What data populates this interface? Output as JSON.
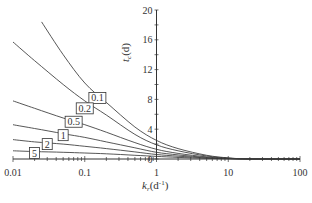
{
  "chart_data": {
    "type": "line",
    "title": "",
    "xlabel": "k_r(d⁻¹)",
    "xlabel_main": "k",
    "xlabel_sub": "r",
    "xlabel_unit": "(d",
    "xlabel_sup": "-1",
    "xlabel_close": ")",
    "ylabel": "t_c(d)",
    "ylabel_main": "t",
    "ylabel_sub": "c",
    "ylabel_unit": "(d)",
    "xscale": "log",
    "xlim": [
      0.01,
      100
    ],
    "ylim": [
      0,
      20
    ],
    "grid": false,
    "legend": "inline labels on curves",
    "x_tick_labels": [
      "0.01",
      "0.1",
      "1",
      "10",
      "100"
    ],
    "y_tick_labels": [
      "0",
      "4",
      "8",
      "12",
      "16",
      "20"
    ],
    "series": [
      {
        "name": "0.1",
        "x": [
          0.025,
          0.05,
          0.1,
          0.2,
          0.5,
          1,
          2,
          5,
          10,
          20,
          100
        ],
        "y": [
          18.4,
          14.0,
          10.2,
          7.6,
          4.3,
          2.5,
          1.4,
          0.5,
          0.15,
          0.02,
          0
        ]
      },
      {
        "name": "0.2",
        "x": [
          0.01,
          0.02,
          0.05,
          0.1,
          0.2,
          0.5,
          1,
          2,
          5,
          10,
          20,
          100
        ],
        "y": [
          15.7,
          13.2,
          10.0,
          7.8,
          5.9,
          3.3,
          1.9,
          1.1,
          0.4,
          0.12,
          0.02,
          0
        ]
      },
      {
        "name": "0.5",
        "x": [
          0.01,
          0.02,
          0.05,
          0.1,
          0.2,
          0.5,
          1,
          2,
          5,
          10,
          20,
          100
        ],
        "y": [
          7.8,
          6.8,
          5.5,
          4.6,
          3.6,
          2.2,
          1.3,
          0.75,
          0.28,
          0.09,
          0.01,
          0
        ]
      },
      {
        "name": "1",
        "x": [
          0.01,
          0.02,
          0.05,
          0.1,
          0.2,
          0.5,
          1,
          2,
          5,
          10,
          20,
          100
        ],
        "y": [
          4.6,
          4.1,
          3.4,
          2.9,
          2.3,
          1.5,
          0.9,
          0.55,
          0.2,
          0.07,
          0.01,
          0
        ]
      },
      {
        "name": "2",
        "x": [
          0.01,
          0.02,
          0.05,
          0.1,
          0.2,
          0.5,
          1,
          2,
          5,
          10,
          20,
          100
        ],
        "y": [
          2.6,
          2.3,
          2.0,
          1.7,
          1.4,
          0.95,
          0.6,
          0.38,
          0.14,
          0.05,
          0.01,
          0
        ]
      },
      {
        "name": "5",
        "x": [
          0.01,
          0.02,
          0.05,
          0.1,
          0.2,
          0.5,
          1,
          2,
          5,
          10,
          20,
          100
        ],
        "y": [
          1.1,
          1.0,
          0.9,
          0.8,
          0.7,
          0.5,
          0.35,
          0.22,
          0.09,
          0.03,
          0.005,
          0
        ]
      }
    ],
    "curve_labels": [
      {
        "text": "0.1",
        "x": 0.15,
        "y": 8.2
      },
      {
        "text": "0.2",
        "x": 0.1,
        "y": 6.8
      },
      {
        "text": "0.5",
        "x": 0.07,
        "y": 5.0
      },
      {
        "text": "1",
        "x": 0.05,
        "y": 3.2
      },
      {
        "text": "2",
        "x": 0.03,
        "y": 2.0
      },
      {
        "text": "5",
        "x": 0.02,
        "y": 0.8
      }
    ]
  }
}
